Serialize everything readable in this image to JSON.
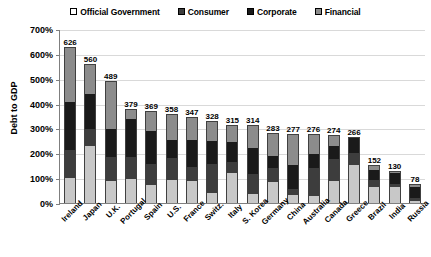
{
  "chart_data": {
    "type": "bar",
    "subtype": "stacked-column",
    "title": "",
    "xlabel": "",
    "ylabel": "Debt to GDP",
    "ylim": [
      0,
      700
    ],
    "ytick_step": 100,
    "ytick_labels": [
      "700%",
      "600%",
      "500%",
      "400%",
      "300%",
      "200%",
      "100%",
      "0%"
    ],
    "grid": true,
    "legend_position": "top",
    "value_label_suffix": "",
    "categories": [
      "Ireland",
      "Japan",
      "U.K.",
      "Portugal",
      "Spain",
      "U.S.",
      "France",
      "Switz.",
      "Italy",
      "S. Korea",
      "Germany",
      "China",
      "Australia",
      "Canada",
      "Greece",
      "Brazil",
      "India",
      "Russia"
    ],
    "totals": [
      626,
      560,
      489,
      379,
      369,
      358,
      347,
      328,
      315,
      314,
      283,
      277,
      276,
      274,
      266,
      152,
      130,
      78
    ],
    "series": [
      {
        "name": "Official Government",
        "color": "#c8c8c8",
        "values": [
          100,
          230,
          88,
          97,
          73,
          92,
          89,
          40,
          122,
          36,
          84,
          31,
          28,
          88,
          165,
          66,
          68,
          10
        ]
      },
      {
        "name": "Consumer",
        "color": "#3d3d3d",
        "values": [
          115,
          70,
          100,
          92,
          84,
          90,
          56,
          118,
          45,
          81,
          60,
          28,
          113,
          92,
          51,
          30,
          12,
          12
        ]
      },
      {
        "name": "Corporate",
        "color": "#1a1a1a",
        "values": [
          194,
          143,
          114,
          153,
          134,
          76,
          111,
          94,
          82,
          107,
          49,
          96,
          59,
          53,
          65,
          42,
          43,
          48
        ]
      },
      {
        "name": "Financial",
        "color": "#8c8c8c",
        "values": [
          217,
          117,
          187,
          37,
          78,
          100,
          91,
          76,
          66,
          90,
          90,
          122,
          76,
          41,
          -15,
          14,
          7,
          8
        ]
      }
    ]
  },
  "legend": {
    "items": [
      {
        "label": "Official Government",
        "swatch": "#ffffff"
      },
      {
        "label": "Consumer",
        "swatch": "#3d3d3d"
      },
      {
        "label": "Corporate",
        "swatch": "#1a1a1a"
      },
      {
        "label": "Financial",
        "swatch": "#8c8c8c"
      }
    ]
  },
  "axis": {
    "y_title": "Debt to GDP"
  }
}
